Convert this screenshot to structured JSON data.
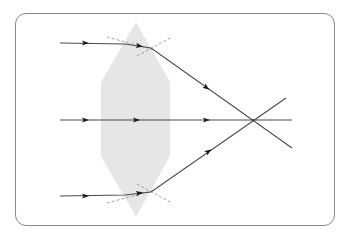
{
  "diagram": {
    "colors": {
      "frame": "#8a8a8a",
      "lens": "#e6e6e6",
      "ray": "#4a4a4a",
      "arrow": "#1a1a1a",
      "normal": "#9a9a9a"
    },
    "lens": {
      "shape": "hexagon",
      "points": "136,22 170,82 170,156 136,217 101,156 101,82"
    },
    "rays": [
      {
        "id": "top",
        "path": "60,43 125,44 151,48 292,148",
        "arrows": [
          [
            86,
            43,
            0
          ],
          [
            140,
            46,
            8
          ],
          [
            207,
            88,
            35
          ]
        ]
      },
      {
        "id": "middle",
        "path": "60,120 292,120",
        "arrows": [
          [
            86,
            120,
            0
          ],
          [
            137,
            120,
            0
          ],
          [
            207,
            120,
            0
          ]
        ]
      },
      {
        "id": "bottom",
        "path": "60,196 125,195 151,192 286,98",
        "arrows": [
          [
            86,
            196,
            0
          ],
          [
            140,
            193,
            -8
          ],
          [
            209,
            151,
            -35
          ]
        ]
      }
    ],
    "normals": [
      {
        "x1": 107,
        "y1": 37,
        "x2": 155,
        "y2": 50
      },
      {
        "x1": 137,
        "y1": 56,
        "x2": 172,
        "y2": 37
      },
      {
        "x1": 107,
        "y1": 203,
        "x2": 155,
        "y2": 190
      },
      {
        "x1": 137,
        "y1": 184,
        "x2": 172,
        "y2": 203
      }
    ],
    "focal_point": {
      "x": 253,
      "y": 120
    }
  }
}
